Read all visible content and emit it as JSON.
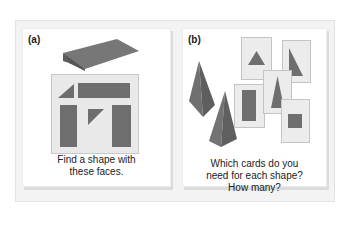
{
  "panels": {
    "a": {
      "label": "(a)",
      "caption_line1": "Find a shape with",
      "caption_line2": "these faces.",
      "solid": "triangular-prism",
      "faces": [
        "triangle",
        "rectangle",
        "rectangle",
        "triangle",
        "rectangle"
      ]
    },
    "b": {
      "label": "(b)",
      "caption_line1": "Which cards do you",
      "caption_line2": "need for each shape?",
      "caption_line3": "How many?",
      "solids": [
        "triangular-pyramid",
        "square-pyramid"
      ],
      "cards": [
        "equilateral-triangle",
        "right-triangle",
        "rectangle",
        "isosceles-triangle",
        "square"
      ]
    }
  },
  "colors": {
    "shape_fill": "#6e6e6e",
    "shape_dark": "#585858",
    "card_bg": "#ececec",
    "frame_bg": "#f3f3f3"
  }
}
